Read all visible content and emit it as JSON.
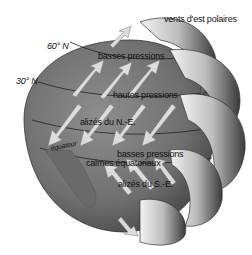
{
  "diagram": {
    "title": "",
    "labels": {
      "polar_easterlies": "vents d'est polaires",
      "lat_60": "60° N",
      "lat_30": "30° N",
      "low_pressure_north": "basses pressions",
      "high_pressure": "hautes pressions",
      "ne_trades": "alizés du N.-E.",
      "equator": "équateur",
      "low_pressure_equator": "basses pressions",
      "doldrums": "calmes équatoriaux",
      "se_trades": "alizés du S.-E."
    },
    "colors": {
      "globe": "#7a7a7a",
      "globe_dark": "#4a4a4a",
      "arrow": "#d8d8d8",
      "cell_light": "#e6e6e6",
      "cell_dark": "#2a2a2a",
      "text": "#111111"
    }
  }
}
